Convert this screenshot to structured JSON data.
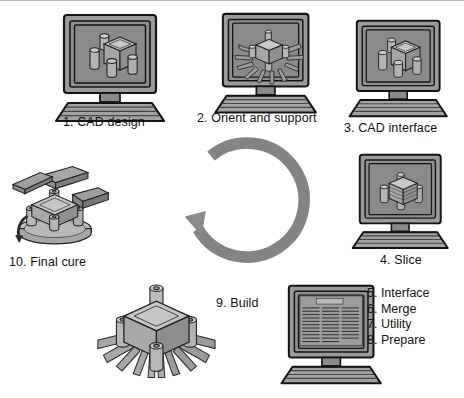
{
  "figure": {
    "background_color": "#ffffff",
    "border_color": "#b9bcc0",
    "palette": {
      "outline": "#1a1a1a",
      "monitor_case": "#9a9a9a",
      "monitor_case_dark": "#7d7d7d",
      "screen": "#8c8c8c",
      "screen_inner": "#7e7e7e",
      "keyboard": "#a0a0a0",
      "part_light": "#c9c9c9",
      "part_mid": "#a8a8a8",
      "part_dark": "#8a8a8a",
      "arrow": "#8a8a8a",
      "text": "#111111"
    }
  },
  "steps": [
    {
      "id": "step-1",
      "number": "1.",
      "label": "1. CAD design",
      "kind": "monitor",
      "screen_content": "cad-solid-model"
    },
    {
      "id": "step-2",
      "number": "2.",
      "label": "2. Orient and support",
      "kind": "monitor",
      "screen_content": "cad-model-with-supports"
    },
    {
      "id": "step-3",
      "number": "3.",
      "label": "3. CAD interface",
      "kind": "monitor",
      "screen_content": "cad-solid-model"
    },
    {
      "id": "step-4",
      "number": "4.",
      "label": "4. Slice",
      "kind": "monitor",
      "screen_content": "cad-sliced-model"
    },
    {
      "id": "step-5-8",
      "number": "5.",
      "label": "5. Interface",
      "kind": "monitor",
      "screen_content": "prepare-list-view",
      "screen_title": "PREPARE",
      "grouped_labels": [
        "5. Interface",
        "6. Merge",
        "7. Utility",
        "8. Prepare"
      ]
    },
    {
      "id": "step-9",
      "number": "9.",
      "label": "9. Build",
      "kind": "part",
      "screen_content": "built-part-with-supports"
    },
    {
      "id": "step-10",
      "number": "10.",
      "label": "10. Final cure",
      "kind": "part",
      "screen_content": "part-with-supports-removed"
    }
  ],
  "cycle_arrow": {
    "name": "process-cycle-arrow",
    "direction": "counter-clockwise",
    "color": "#8a8a8a"
  }
}
